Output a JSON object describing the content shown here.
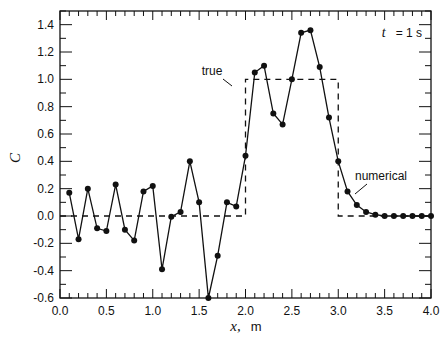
{
  "chart_data": {
    "type": "line",
    "title": "",
    "xlabel": "x, m",
    "xlabel_var": "x",
    "xlabel_unit": "m",
    "ylabel": "C",
    "xlim": [
      0.0,
      4.0
    ],
    "ylim": [
      -0.6,
      1.5
    ],
    "x_ticks": [
      "0.0",
      "0.5",
      "1.0",
      "1.5",
      "2.0",
      "2.5",
      "3.0",
      "3.5",
      "4.0"
    ],
    "y_ticks": [
      "-0.6",
      "-0.4",
      "-0.2",
      "0.0",
      "0.2",
      "0.4",
      "0.6",
      "0.8",
      "1.0",
      "1.2",
      "1.4"
    ],
    "grid": false,
    "annotations": [
      {
        "text": "t = 1 s",
        "position": "top-right"
      },
      {
        "text": "true",
        "points_to": "true series near x=2.0, y=1.0"
      },
      {
        "text": "numerical",
        "points_to": "numerical series near x=3.2, y=0.05"
      }
    ],
    "series": [
      {
        "name": "true",
        "style": "dashed",
        "x": [
          0.0,
          2.0,
          2.0,
          3.0,
          3.0,
          4.0
        ],
        "values": [
          0.0,
          0.0,
          1.0,
          1.0,
          0.0,
          0.0
        ]
      },
      {
        "name": "numerical",
        "style": "solid-with-markers",
        "x": [
          0.1,
          0.2,
          0.3,
          0.4,
          0.5,
          0.6,
          0.7,
          0.8,
          0.9,
          1.0,
          1.1,
          1.2,
          1.3,
          1.4,
          1.5,
          1.6,
          1.7,
          1.8,
          1.9,
          2.0,
          2.1,
          2.2,
          2.3,
          2.4,
          2.5,
          2.6,
          2.7,
          2.8,
          2.9,
          3.0,
          3.1,
          3.2,
          3.3,
          3.4,
          3.5,
          3.6,
          3.7,
          3.8,
          3.9,
          4.0
        ],
        "values": [
          0.17,
          -0.17,
          0.2,
          -0.09,
          -0.11,
          0.23,
          -0.1,
          -0.18,
          0.18,
          0.22,
          -0.39,
          -0.005,
          0.03,
          0.4,
          0.1,
          -0.6,
          -0.29,
          0.1,
          0.07,
          0.44,
          1.05,
          1.1,
          0.75,
          0.67,
          1.0,
          1.34,
          1.36,
          1.09,
          0.72,
          0.4,
          0.18,
          0.08,
          0.03,
          0.01,
          0.0,
          0.0,
          0.0,
          0.0,
          0.0,
          0.0
        ]
      }
    ]
  },
  "labels": {
    "time": "t = 1 s",
    "time_var": "t",
    "time_rest": "= 1 s",
    "true_label": "true",
    "numerical_label": "numerical",
    "xlabel_var": "x,",
    "xlabel_unit": "m",
    "ylabel": "C"
  }
}
